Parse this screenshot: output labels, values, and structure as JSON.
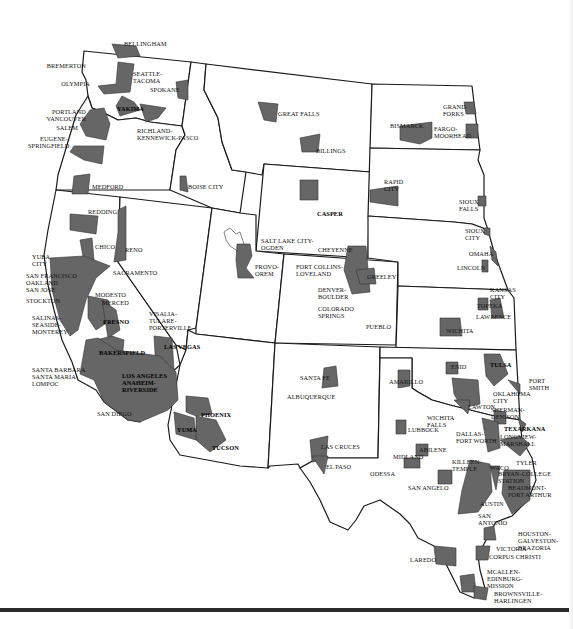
{
  "map": {
    "title": "Metropolitan Areas — Western United States",
    "fill_color": "#666666",
    "border_color": "#1a1a1a",
    "background": "#ffffff"
  },
  "labels": {
    "bellingham": "BELLINGHAM",
    "bremerton": "BREMERTON",
    "olympia": "OLYMPIA",
    "seattle": "SEATTLE-\nTACOMA",
    "spokane": "SPOKANE",
    "yakima": "YAKIMA",
    "portland": "PORTLAND\nVANCOUVER",
    "salem": "SALEM",
    "richland": "RICHLAND-\nKENNEWICK-PASCO",
    "eugene": "EUGENE-\nSPRINGFIELD",
    "medford": "MEDFORD",
    "boise": "BOISE CITY",
    "great_falls": "GREAT FALLS",
    "billings": "BILLINGS",
    "bismarck": "BISMARCK",
    "grand_forks": "GRAND\nFORKS",
    "fargo": "FARGO-\nMOORHEAD",
    "rapid_city": "RAPID\nCITY",
    "sioux_falls": "SIOUX\nFALLS",
    "sioux_city": "SIOUX\nCITY",
    "omaha": "OMAHA",
    "lincoln": "LINCOLN",
    "redding": "REDDING",
    "chico": "CHICO",
    "reno": "RENO",
    "yuba": "YUBA\nCITY",
    "sacramento": "SACRAMENTO",
    "sf": "SAN FRANCISCO\nOAKLAND\nSAN JOSE",
    "stockton": "STOCKTON",
    "modesto": "MODESTO",
    "merced": "MERCED",
    "salinas": "SALINAS-\nSEASIDE-\nMONTEREY",
    "fresno": "FRESNO",
    "visalia": "VISALIA-\nTULARE-\nPORTERVILLE",
    "bakersfield": "BAKERSFIELD",
    "las_vegas": "LAS VEGAS",
    "santa_barbara": "SANTA BARBARA\nSANTA MARIA-\nLOMPOC",
    "la": "LOS ANGELES\nANAHEIM-\nRIVERSIDE",
    "san_diego": "SAN DIEGO",
    "phoenix": "PHOENIX",
    "yuma": "YUMA",
    "tucson": "TUCSON",
    "casper": "CASPER",
    "slc": "SALT LAKE CITY-\nOGDEN",
    "provo": "PROVO-\nOREM",
    "cheyenne": "CHEYENNE",
    "fort_collins": "FORT COLLINS-\nLOVELAND",
    "greeley": "GREELEY",
    "denver": "DENVER-\nBOULDER",
    "colorado_springs": "COLORADO\nSPRINGS",
    "pueblo": "PUEBLO",
    "kansas_city": "KANSAS\nCITY",
    "topeka": "TOPEKA",
    "lawrence": "LAWRENCE",
    "wichita": "WICHITA",
    "santa_fe": "SANTA FE",
    "albuquerque": "ALBUQUERQUE",
    "las_cruces": "LAS CRUCES",
    "el_paso": "EL PASO",
    "amarillo": "AMARILLO",
    "enid": "ENID",
    "tulsa": "TULSA",
    "fort_smith": "FORT\nSMITH",
    "okc": "OKLAHOMA\nCITY",
    "lawton": "LAWTON",
    "sherman": "SHERMAN-\nDENISON",
    "wichita_falls": "WICHITA\nFALLS",
    "lubbock": "LUBBOCK",
    "dallas": "DALLAS-\nFORT WORTH",
    "texarkana": "TEXARKANA",
    "longview": "LONGVIEW-\nMARSHALL",
    "abilene": "ABILENE",
    "midland": "MIDLAND",
    "odessa": "ODESSA",
    "tyler": "TYLER",
    "killeen": "KILLEEN-\nTEMPLE",
    "waco": "WACO",
    "bryan": "BRYAN-COLLEGE\nSTATION",
    "san_angelo": "SAN ANGELO",
    "beaumont": "BEAUMONT-\nPORT ARTHUR",
    "austin": "AUSTIN",
    "san_antonio": "SAN\nANTONIO",
    "houston": "HOUSTON-\nGALVESTON-\nBRAZORIA",
    "victoria": "VICTORIA",
    "corpus": "CORPUS CHRISTI",
    "laredo": "LAREDO",
    "mcallen": "McALLEN-\nEDINBURG-\nMISSION",
    "brownsville": "BROWNSVILLE-\nHARLINGEN"
  }
}
